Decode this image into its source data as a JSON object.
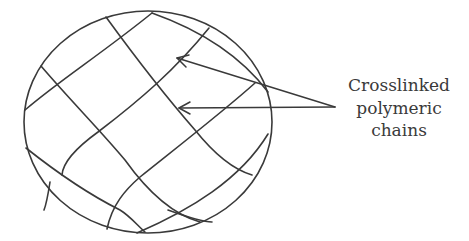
{
  "diagram": {
    "stroke_color": "#3a3a3a",
    "background": "#ffffff",
    "label": {
      "lines": [
        "Crosslinked",
        "polymeric",
        "chains"
      ]
    },
    "arrows": [
      {
        "from": [
          335,
          107
        ],
        "to": [
          177,
          58
        ]
      },
      {
        "from": [
          335,
          107
        ],
        "to": [
          179,
          108
        ]
      }
    ]
  }
}
